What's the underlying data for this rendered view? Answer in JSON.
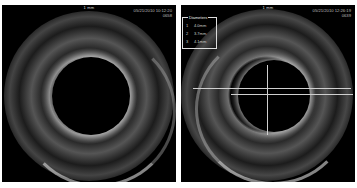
{
  "image": {
    "description": "Side-by-side intravascular ultrasound (IVUS) cross-sections of a vessel",
    "background": "#ffffff",
    "panel_background": "#000000"
  },
  "panels": [
    {
      "id": "left",
      "scale_label": "1 mm",
      "timestamp": "05/21/2010 10:12:20",
      "frame": "0658"
    },
    {
      "id": "right",
      "scale_label": "1 mm",
      "timestamp": "05/21/2010 12:26:19",
      "frame": "0639",
      "measurements": {
        "title": "Diameters",
        "rows": [
          {
            "index": "1",
            "value": "4.0mm"
          },
          {
            "index": "2",
            "value": "3.7mm"
          },
          {
            "index": "3",
            "value": "4.1mm"
          }
        ]
      },
      "crosshair_color": "#cfcfcf"
    }
  ]
}
